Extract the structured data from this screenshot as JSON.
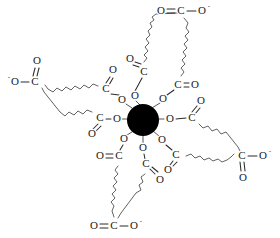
{
  "diagram": {
    "type": "chemical-structure",
    "background_color": "#ffffff",
    "bond_color": "#2b2b2b",
    "chain_color": "#5a5a5a",
    "metal": {
      "label": "",
      "shape": "filled-circle",
      "color": "#000000",
      "center_x": 143,
      "center_y": 120,
      "radius": 16,
      "coordination_number": 8
    },
    "labels": {
      "O": "O",
      "C": "C",
      "minus": "-"
    },
    "coordinating_oxygens": [
      {
        "id": "o1",
        "label": "O",
        "x": 135,
        "y": 96
      },
      {
        "id": "o2",
        "label": "O",
        "x": 163,
        "y": 99
      },
      {
        "id": "o3",
        "label": "O",
        "x": 170,
        "y": 119
      },
      {
        "id": "o4",
        "label": "O",
        "x": 162,
        "y": 140
      },
      {
        "id": "o5",
        "label": "O",
        "x": 143,
        "y": 148
      },
      {
        "id": "o6",
        "label": "O",
        "x": 124,
        "y": 139
      },
      {
        "id": "o7",
        "label": "O",
        "x": 117,
        "y": 119
      },
      {
        "id": "o8",
        "label": "O",
        "x": 122,
        "y": 100
      }
    ],
    "inner_carboxylates": [
      {
        "id": "c1",
        "label": "C",
        "x": 144,
        "y": 72,
        "carbonyl_label": "O",
        "carbonyl_x": 130,
        "carbonyl_y": 59
      },
      {
        "id": "c2",
        "label": "C",
        "x": 178,
        "y": 85,
        "carbonyl_label": "O",
        "carbonyl_x": 195,
        "carbonyl_y": 85
      },
      {
        "id": "c3",
        "label": "C",
        "x": 192,
        "y": 118,
        "carbonyl_label": "O",
        "carbonyl_x": 201,
        "carbonyl_y": 101
      },
      {
        "id": "c4",
        "label": "C",
        "x": 176,
        "y": 155,
        "carbonyl_label": "O",
        "carbonyl_x": 168,
        "carbonyl_y": 170
      },
      {
        "id": "c5",
        "label": "C",
        "x": 146,
        "y": 164,
        "carbonyl_label": "O",
        "carbonyl_x": 160,
        "carbonyl_y": 180
      },
      {
        "id": "c6",
        "label": "C",
        "x": 119,
        "y": 156,
        "carbonyl_label": "O",
        "carbonyl_x": 100,
        "carbonyl_y": 156
      },
      {
        "id": "c7",
        "label": "C",
        "x": 100,
        "y": 118,
        "carbonyl_label": "O",
        "carbonyl_x": 92,
        "carbonyl_y": 134
      },
      {
        "id": "c8",
        "label": "C",
        "x": 106,
        "y": 89,
        "carbonyl_label": "O",
        "carbonyl_x": 113,
        "carbonyl_y": 70
      }
    ],
    "outer_carboxylates": [
      {
        "id": "top",
        "position": "top",
        "formula": "O=C-O-",
        "carbon": {
          "label": "C",
          "x": 181,
          "y": 11
        },
        "oxygen_double": {
          "label": "O",
          "x": 161,
          "y": 11
        },
        "oxygen_single": {
          "label": "O",
          "x": 202,
          "y": 11
        },
        "charge": "-"
      },
      {
        "id": "left",
        "position": "left",
        "formula": "-O-C(=O)",
        "carbon": {
          "label": "C",
          "x": 35,
          "y": 82
        },
        "oxygen_double": {
          "label": "O",
          "x": 37,
          "y": 61
        },
        "oxygen_single": {
          "label": "O",
          "x": 15,
          "y": 82
        },
        "charge": "-"
      },
      {
        "id": "right",
        "position": "right",
        "formula": "C(=O)-O-",
        "carbon": {
          "label": "C",
          "x": 242,
          "y": 156
        },
        "oxygen_double": {
          "label": "O",
          "x": 243,
          "y": 178
        },
        "oxygen_single": {
          "label": "O",
          "x": 263,
          "y": 156
        },
        "charge": "-"
      },
      {
        "id": "bottom",
        "position": "bottom",
        "formula": "O=C-O-",
        "carbon": {
          "label": "C",
          "x": 114,
          "y": 226
        },
        "oxygen_double": {
          "label": "O",
          "x": 94,
          "y": 226
        },
        "oxygen_single": {
          "label": "O",
          "x": 134,
          "y": 226
        },
        "charge": "-"
      }
    ]
  }
}
